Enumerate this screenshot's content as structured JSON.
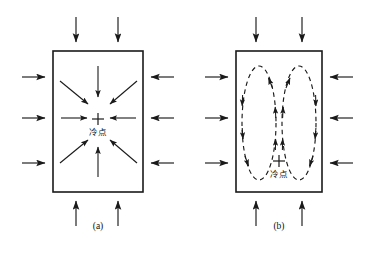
{
  "figure": {
    "background_color": "#ffffff",
    "stroke_color": "#1a1a1a",
    "panels": [
      {
        "id": "a",
        "caption": "(a)",
        "box": {
          "x": 53,
          "y": 51,
          "w": 90,
          "h": 141
        },
        "center_marker": "+",
        "center_label": "冷点",
        "flow_type": "converging-arrows",
        "external_arrows": {
          "left": [
            {
              "y": 77
            },
            {
              "y": 118
            },
            {
              "y": 163
            }
          ],
          "right": [
            {
              "y": 77
            },
            {
              "y": 118
            },
            {
              "y": 163
            }
          ],
          "top": [
            {
              "x": 76
            },
            {
              "x": 118
            }
          ],
          "bottom": [
            {
              "x": 76
            },
            {
              "x": 118
            }
          ]
        },
        "internal_arrows": [
          {
            "dir": "down",
            "x1": 98,
            "y1": 68,
            "x2": 98,
            "y2": 96
          },
          {
            "dir": "up",
            "x1": 98,
            "y1": 175,
            "x2": 98,
            "y2": 148
          },
          {
            "dir": "right",
            "x1": 62,
            "y1": 118,
            "x2": 86,
            "y2": 118
          },
          {
            "dir": "left",
            "x1": 136,
            "y1": 118,
            "x2": 112,
            "y2": 118
          },
          {
            "dir": "down-right",
            "x1": 60,
            "y1": 82,
            "x2": 87,
            "y2": 103
          },
          {
            "dir": "down-left",
            "x1": 137,
            "y1": 82,
            "x2": 111,
            "y2": 103
          },
          {
            "dir": "up-right",
            "x1": 60,
            "y1": 162,
            "x2": 87,
            "y2": 141
          },
          {
            "dir": "up-left",
            "x1": 137,
            "y1": 162,
            "x2": 111,
            "y2": 141
          }
        ]
      },
      {
        "id": "b",
        "caption": "(b)",
        "box": {
          "x": 236,
          "y": 51,
          "w": 86,
          "h": 141
        },
        "center_marker": "+",
        "center_label": "冷点",
        "flow_type": "dashed-convection-cells",
        "external_arrows": {
          "left": [
            {
              "y": 77
            },
            {
              "y": 118
            },
            {
              "y": 163
            }
          ],
          "right": [
            {
              "y": 77
            },
            {
              "y": 118
            },
            {
              "y": 163
            }
          ],
          "top": [
            {
              "x": 256
            },
            {
              "x": 302
            }
          ],
          "bottom": [
            {
              "x": 256
            },
            {
              "x": 302
            }
          ]
        },
        "cells": [
          {
            "name": "left-cell",
            "cx": 259,
            "cy": 123,
            "rx": 17,
            "ry": 57,
            "rotation": "counter-clockwise"
          },
          {
            "name": "right-cell",
            "cx": 299,
            "cy": 123,
            "rx": 17,
            "ry": 57,
            "rotation": "clockwise"
          }
        ]
      }
    ]
  }
}
